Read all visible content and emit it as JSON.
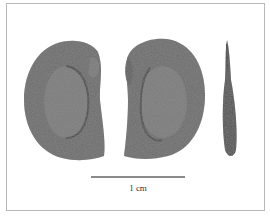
{
  "figure": {
    "views": [
      {
        "name": "face-view-left",
        "description": "seed face showing central depression, hilum notch on right"
      },
      {
        "name": "face-view-right",
        "description": "seed opposite face, notch on left"
      },
      {
        "name": "lateral-view",
        "description": "thin edge-on profile"
      }
    ],
    "scale_bar": {
      "label": "1 cm"
    },
    "colors": {
      "seed_dark": "#4a4a4a",
      "seed_mid": "#6e6e6e",
      "seed_inner": "#7a7a7a",
      "frame": "#b8b8b8",
      "background": "#ffffff"
    }
  }
}
